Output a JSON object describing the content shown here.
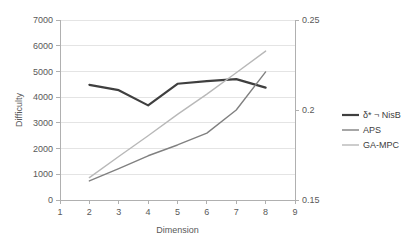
{
  "chart_data": {
    "type": "line",
    "title": "",
    "xlabel": "Dimension",
    "ylabel": "Difficulty",
    "y2label": "",
    "xlim": [
      1,
      9
    ],
    "ylim": [
      0,
      7000
    ],
    "y2lim": [
      0.15,
      0.25
    ],
    "grid": true,
    "legend_position": "right",
    "x_ticks": [
      1,
      2,
      3,
      4,
      5,
      6,
      7,
      8,
      9
    ],
    "x_tick_labels": [
      "1",
      "2",
      "3",
      "4",
      "5",
      "6",
      "7",
      "8",
      "9"
    ],
    "y_ticks": [
      0,
      1000,
      2000,
      3000,
      4000,
      5000,
      6000,
      7000
    ],
    "y_tick_labels": [
      "0",
      "1000",
      "2000",
      "3000",
      "4000",
      "5000",
      "6000",
      "7000"
    ],
    "y2_ticks": [
      0.15,
      0.2,
      0.25
    ],
    "y2_tick_labels": [
      "0.15",
      "0.2",
      "0.25"
    ],
    "x": [
      2,
      3,
      4,
      5,
      6,
      7,
      8
    ],
    "series": [
      {
        "name": "δ* ¬ NisB",
        "axis": "left",
        "color": "#3f3f3f",
        "width": 2.2,
        "values": [
          4480,
          4270,
          3680,
          4520,
          4620,
          4700,
          4370
        ]
      },
      {
        "name": "APS",
        "axis": "left",
        "color": "#808080",
        "width": 1.4,
        "values": [
          740,
          1220,
          1720,
          2140,
          2600,
          3500,
          4980
        ]
      },
      {
        "name": "GA-MPC",
        "axis": "left",
        "color": "#b8b8b8",
        "width": 1.4,
        "values": [
          870,
          1690,
          2500,
          3330,
          4120,
          4950,
          5790
        ]
      }
    ]
  },
  "legend": {
    "entries": [
      {
        "label": "δ* ¬ NisB",
        "color": "#3f3f3f",
        "width": 2.2
      },
      {
        "label": "APS",
        "color": "#808080",
        "width": 1.4
      },
      {
        "label": "GA-MPC",
        "color": "#b8b8b8",
        "width": 1.4
      }
    ]
  },
  "colors": {
    "background": "#ffffff",
    "gridline": "#e4e4e4",
    "axis": "#b0b0b0",
    "text": "#595959"
  }
}
